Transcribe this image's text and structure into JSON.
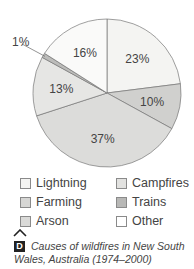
{
  "chart_data": {
    "type": "pie",
    "title": "Causes of wildfires in New South Wales, Australia (1974–2000)",
    "slices": [
      {
        "label": "23%",
        "value": 23,
        "color": "#f4f4f2"
      },
      {
        "label": "10%",
        "value": 10,
        "color": "#d0d0ce"
      },
      {
        "label": "37%",
        "value": 37,
        "color": "#dcdcda"
      },
      {
        "label": "13%",
        "value": 13,
        "color": "#e6e6e4"
      },
      {
        "label": "1%",
        "value": 1,
        "color": "#bcbcba"
      },
      {
        "label": "16%",
        "value": 16,
        "color": "#fafaf9"
      }
    ],
    "legend": [
      {
        "label": "Lightning",
        "color": "#f4f4f2"
      },
      {
        "label": "Campfires",
        "color": "#e2e2e0"
      },
      {
        "label": "Farming",
        "color": "#d6d6d4"
      },
      {
        "label": "Trains",
        "color": "#b8b8b6"
      },
      {
        "label": "Arson",
        "color": "#dadad8"
      },
      {
        "label": "Other",
        "color": "#ffffff"
      }
    ]
  },
  "caption": {
    "badge": "D",
    "text": "Causes of wildfires in New South Wales, Australia (1974–2000)"
  }
}
